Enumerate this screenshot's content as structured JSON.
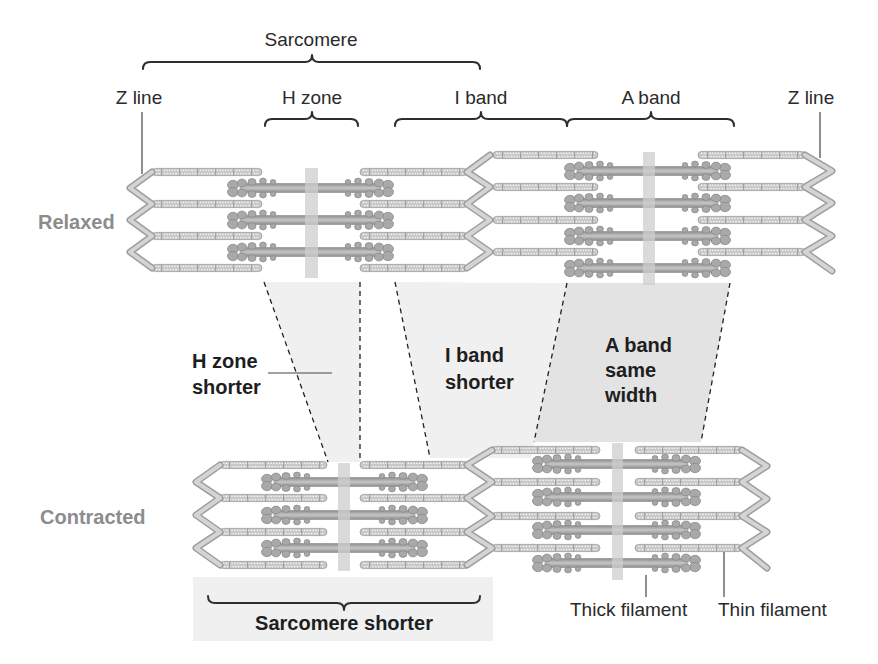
{
  "figure": {
    "top_labels": {
      "sarcomere": "Sarcomere",
      "z_line_left": "Z line",
      "h_zone": "H zone",
      "i_band": "I band",
      "a_band": "A band",
      "z_line_right": "Z line"
    },
    "states": {
      "relaxed": "Relaxed",
      "contracted": "Contracted"
    },
    "annotations": {
      "h_zone": [
        "H zone",
        "shorter"
      ],
      "i_band": [
        "I band",
        "shorter"
      ],
      "a_band": [
        "A band",
        "same",
        "width"
      ],
      "sarcomere": "Sarcomere shorter"
    },
    "bottom_labels": {
      "thick_filament": "Thick filament",
      "thin_filament": "Thin filament"
    }
  },
  "colors": {
    "label_text": "#2a2a2a",
    "state_label": "#8c8c8c",
    "band_fill": "#f0f0f0",
    "a_band_fill": "#e3e3e3",
    "thin_filament": "#c9c9c9",
    "thick_filament": "#a0a0a0",
    "z_line": "#c8c8c8",
    "m_line": "#cdcdcd"
  }
}
